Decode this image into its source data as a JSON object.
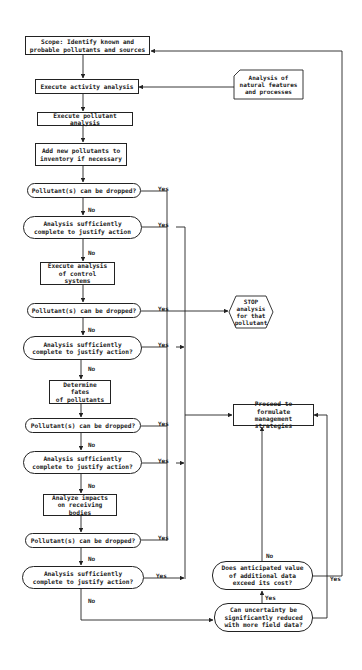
{
  "diagram": {
    "type": "flowchart",
    "main_column": {
      "scope": "Scope: Identify known and\nprobable pollutants and sources",
      "activity": "Execute activity analysis",
      "pollutant_analysis": "Execute pollutant analysis",
      "add_pollutants": "Add new pollutants to\ninventory if necessary",
      "decision_1": "Pollutant(s) can be dropped?",
      "decision_2": "Analysis sufficiently\ncomplete to justify action",
      "control_systems": "Execute analysis\nof control systems",
      "decision_3": "Pollutant(s) can be dropped?",
      "decision_4": "Analysis sufficiently\ncomplete to justify action?",
      "fates": "Determine fates\nof pollutants",
      "decision_5": "Pollutant(s) can be dropped?",
      "decision_6": "Analysis sufficiently\ncomplete to justify action?",
      "impacts": "Analyze impacts\non receiving bodies",
      "decision_7": "Pollutant(s) can be dropped?",
      "decision_8": "Analysis sufficiently\ncomplete to justify action?"
    },
    "side": {
      "natural_features": "Analysis of\nnatural features\nand processes",
      "stop": "STOP\nanalysis\nfor that\npollutant",
      "proceed": "Proceed to formulate\nmanagement strategies",
      "anticipated_value": "Does anticipated value\nof additional data\nexceed its cost?",
      "uncertainty": "Can uncertainty be\nsignificantly reduced\nwith more field data?"
    },
    "labels": {
      "yes": "Yes",
      "no": "No"
    }
  }
}
